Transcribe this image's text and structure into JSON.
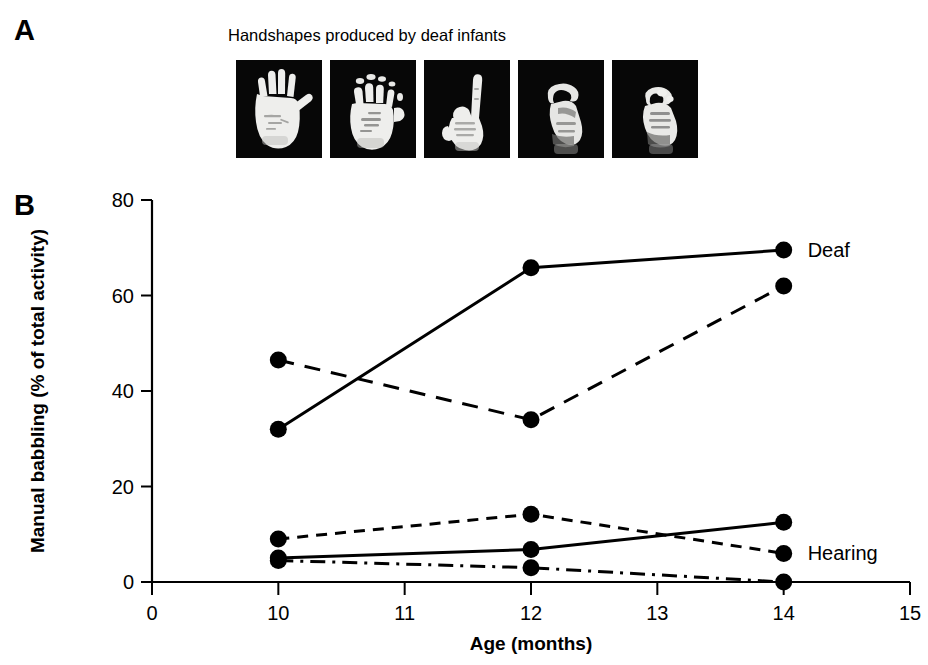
{
  "figure": {
    "panel_a": {
      "letter": "A",
      "title": "Handshapes produced by deaf infants",
      "images": [
        {
          "name": "open-palm-5-handshape",
          "alt": "open palm hand with fingers spread"
        },
        {
          "name": "bent-claw-handshape",
          "alt": "hand with bent curved fingers"
        },
        {
          "name": "pointing-index-1-handshape",
          "alt": "hand pointing with index finger extended"
        },
        {
          "name": "o-curved-handshape",
          "alt": "hand with thumb and fingers curved forming O"
        },
        {
          "name": "closed-fist-handshape",
          "alt": "closed fist hand"
        }
      ]
    },
    "panel_b": {
      "letter": "B"
    }
  },
  "chart_data": {
    "type": "line",
    "title": "",
    "xlabel": "Age (months)",
    "ylabel": "Manual babbling (% of total activity)",
    "x": [
      10,
      12,
      14
    ],
    "xlim": [
      0,
      15
    ],
    "ylim": [
      0,
      80
    ],
    "xticks": [
      0,
      10,
      11,
      12,
      13,
      14,
      15
    ],
    "xtick_labels": [
      "0",
      "10",
      "11",
      "12",
      "13",
      "14",
      "15"
    ],
    "yticks": [
      0,
      20,
      40,
      60,
      80
    ],
    "ytick_labels": [
      "0",
      "20",
      "40",
      "60",
      "80"
    ],
    "grid": false,
    "legend_position": "inline-right",
    "annotations": [
      {
        "text": "Deaf",
        "x": 14,
        "y": 69.5
      },
      {
        "text": "Hearing",
        "x": 14,
        "y": 6
      }
    ],
    "series": [
      {
        "name": "Deaf infant 1",
        "group": "Deaf",
        "style": "solid",
        "values": [
          32,
          65.8,
          69.5
        ]
      },
      {
        "name": "Deaf infant 2",
        "group": "Deaf",
        "style": "dashed",
        "values": [
          46.5,
          34,
          62
        ]
      },
      {
        "name": "Hearing infant 1",
        "group": "Hearing",
        "style": "short-dashed",
        "values": [
          9,
          14.2,
          6
        ]
      },
      {
        "name": "Hearing infant 2",
        "group": "Hearing",
        "style": "solid",
        "values": [
          5,
          6.8,
          12.5
        ]
      },
      {
        "name": "Hearing infant 3",
        "group": "Hearing",
        "style": "dash-dot",
        "values": [
          4.5,
          3,
          0
        ]
      }
    ]
  },
  "colors": {
    "ink": "#000000",
    "background": "#ffffff",
    "photo_background": "#070707",
    "hand": "#f2f2f2"
  }
}
